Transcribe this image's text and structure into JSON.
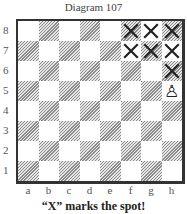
{
  "title": "Diagram 107",
  "caption": "“X” marks the spot!",
  "ranks": [
    "8",
    "7",
    "6",
    "5",
    "4",
    "3",
    "2",
    "1"
  ],
  "files": [
    "a",
    "b",
    "c",
    "d",
    "e",
    "f",
    "g",
    "h"
  ],
  "pieces": [
    {
      "square": "h5",
      "piece": "white-pawn",
      "glyph": "♙"
    }
  ],
  "marks": [
    {
      "square": "f8",
      "symbol": "X"
    },
    {
      "square": "g8",
      "symbol": "X"
    },
    {
      "square": "h8",
      "symbol": "X"
    },
    {
      "square": "f7",
      "symbol": "X"
    },
    {
      "square": "g7",
      "symbol": "X"
    },
    {
      "square": "h7",
      "symbol": "X"
    },
    {
      "square": "h6",
      "symbol": "X"
    }
  ],
  "colors": {
    "border": "#333333",
    "hatch": "#8c8c8c",
    "mark": "#222222"
  }
}
